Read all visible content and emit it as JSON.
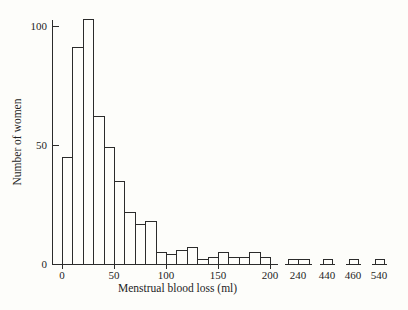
{
  "figure": {
    "xlabel": "Menstrual blood loss (ml)",
    "ylabel": "Number of women"
  },
  "chart_data": {
    "type": "bar",
    "subtype": "histogram",
    "title": "",
    "xlabel": "Menstrual blood loss (ml)",
    "ylabel": "Number of women",
    "bin_width_ml": 10,
    "bin_starts_ml": [
      0,
      10,
      20,
      30,
      40,
      50,
      60,
      70,
      80,
      90,
      100,
      110,
      120,
      130,
      140,
      150,
      160,
      170,
      180,
      190
    ],
    "counts": [
      45,
      91,
      103,
      62,
      49,
      35,
      22,
      17,
      18,
      5,
      4,
      6,
      7,
      2,
      3,
      5,
      3,
      3,
      5,
      3
    ],
    "outlier_groups": [
      {
        "axis_label": "240",
        "counts": [
          2,
          2
        ]
      },
      {
        "axis_label": "440",
        "counts": [
          2
        ]
      },
      {
        "axis_label": "460",
        "counts": [
          2
        ]
      },
      {
        "axis_label": "540",
        "counts": [
          2
        ]
      }
    ],
    "x_tick_labels": [
      "0",
      "50",
      "100",
      "150",
      "200"
    ],
    "x_tick_values_ml": [
      0,
      50,
      100,
      150,
      200
    ],
    "outlier_axis_labels": [
      "240",
      "440",
      "460",
      "540"
    ],
    "y_tick_labels": [
      "0",
      "50",
      "100"
    ],
    "y_tick_values": [
      0,
      50,
      100
    ],
    "ylim": [
      0,
      105
    ],
    "axis_break_after_ml": 200,
    "grid": false,
    "legend": null,
    "bar_fill": "#fdfdfa",
    "line_color": "#2b2b2b"
  },
  "colors": {
    "background": "#fdfdfa",
    "line": "#2b2b2b",
    "text": "#1e1e1e"
  }
}
